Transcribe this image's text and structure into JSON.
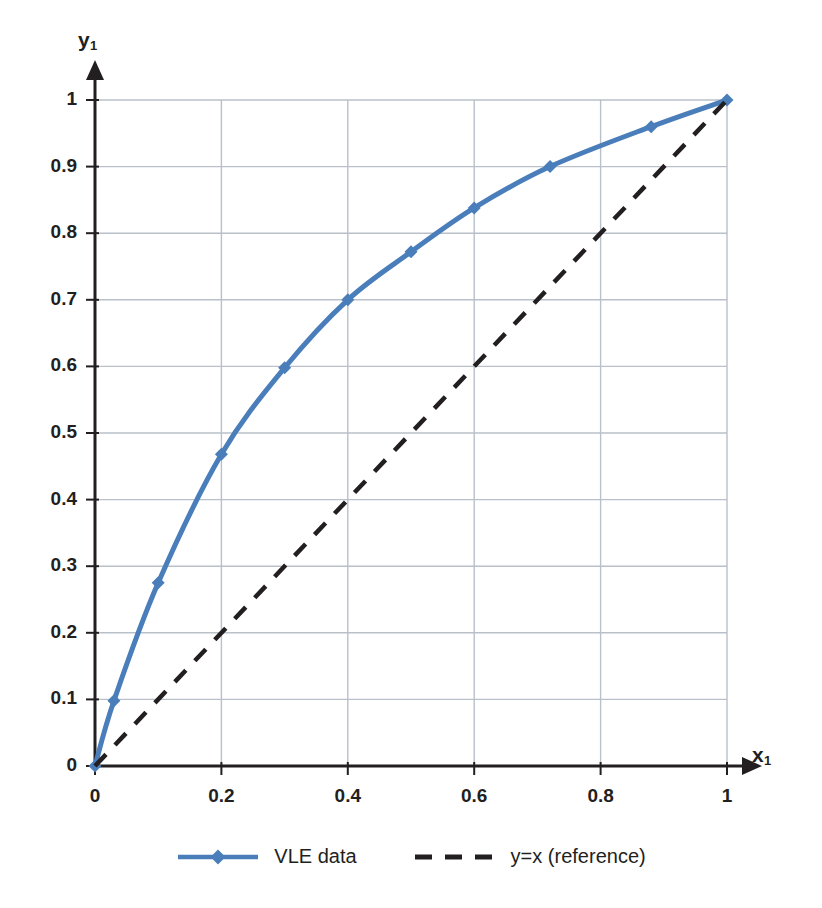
{
  "chart_data": {
    "type": "line",
    "title": "",
    "xlabel": "x1",
    "ylabel": "y1",
    "xlim": [
      0,
      1
    ],
    "ylim": [
      0,
      1
    ],
    "grid": true,
    "legend_position": "bottom",
    "x_ticks": [
      "0",
      "0.2",
      "0.4",
      "0.6",
      "0.8",
      "1"
    ],
    "x_tick_values": [
      0,
      0.2,
      0.4,
      0.6,
      0.8,
      1
    ],
    "y_ticks": [
      "0",
      "0.1",
      "0.2",
      "0.3",
      "0.4",
      "0.5",
      "0.6",
      "0.7",
      "0.8",
      "0.9",
      "1"
    ],
    "y_tick_values": [
      0,
      0.1,
      0.2,
      0.3,
      0.4,
      0.5,
      0.6,
      0.7,
      0.8,
      0.9,
      1
    ],
    "series": [
      {
        "name": "VLE data",
        "style": "solid-with-diamond-markers",
        "color": "#4A7EBB",
        "x": [
          0,
          0.03,
          0.1,
          0.2,
          0.3,
          0.4,
          0.5,
          0.6,
          0.72,
          0.88,
          1.0
        ],
        "y": [
          0,
          0.098,
          0.275,
          0.468,
          0.598,
          0.7,
          0.772,
          0.838,
          0.9,
          0.96,
          1.0
        ]
      },
      {
        "name": "y=x (reference)",
        "style": "dashed",
        "color": "#231f20",
        "x": [
          0,
          1
        ],
        "y": [
          0,
          1
        ]
      }
    ]
  },
  "axes": {
    "y_title_text": "y",
    "y_title_sub": "1",
    "x_title_text": "x",
    "x_title_sub": "1"
  },
  "legend": {
    "entries": [
      {
        "label": "VLE data",
        "color": "#4A7EBB",
        "style": "solid-marker"
      },
      {
        "label": "y=x (reference)",
        "color": "#231f20",
        "style": "dashed"
      }
    ]
  },
  "colors": {
    "series_blue": "#4A7EBB",
    "reference_black": "#231f20",
    "gridline": "#b9c0c9",
    "axis": "#231f20",
    "background": "#ffffff"
  }
}
